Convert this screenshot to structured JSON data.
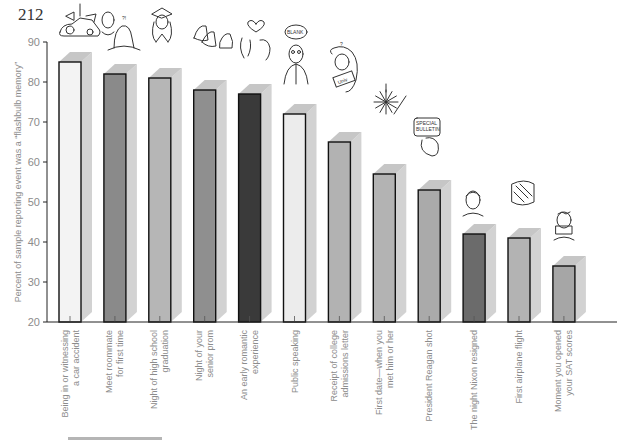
{
  "page": {
    "page_number": "212"
  },
  "illustrations": {
    "blank_bubble": "BLANK",
    "tv_screen_line1": "SPECIAL",
    "tv_screen_line2": "BULLETIN",
    "letter_text": "Univ",
    "roommate_exclaim": "?!",
    "college_question": "?"
  },
  "chart_data": {
    "type": "bar",
    "style": "3d-bar",
    "title": "",
    "xlabel": "",
    "ylabel": "Percent of sample reporting event was a “flashbulb memory”",
    "ylim": [
      20,
      90
    ],
    "yticks": [
      20,
      30,
      40,
      50,
      60,
      70,
      80,
      90
    ],
    "grid": false,
    "legend": "none",
    "categories": [
      [
        "Being in or witnessing",
        "a car accident"
      ],
      [
        "Meet roommate",
        "for first time"
      ],
      [
        "Night of high school",
        "graduation"
      ],
      [
        "Night of your",
        "senior prom"
      ],
      [
        "An early romantic",
        "experience"
      ],
      [
        "Public speaking"
      ],
      [
        "Receipt of college",
        "admissions letter"
      ],
      [
        "First date—when you",
        "met him or her"
      ],
      [
        "President Reagan  shot"
      ],
      [
        "The night Nixon resigned"
      ],
      [
        "First airplane flight"
      ],
      [
        "Moment you opened",
        "your SAT scores"
      ]
    ],
    "values": [
      85,
      82,
      81,
      78,
      77,
      72,
      65,
      57,
      53,
      42,
      41,
      34
    ],
    "bar_colors": [
      "#f3f3f3",
      "#8a8a8a",
      "#b6b6b6",
      "#8f8f8f",
      "#3a3a3a",
      "#ececec",
      "#b2b2b2",
      "#b3b3b3",
      "#aaaaaa",
      "#6b6b6b",
      "#b3b3b3",
      "#a6a6a6"
    ],
    "side_color": "#d2d2d2",
    "top_color": "#c6c6c6"
  }
}
